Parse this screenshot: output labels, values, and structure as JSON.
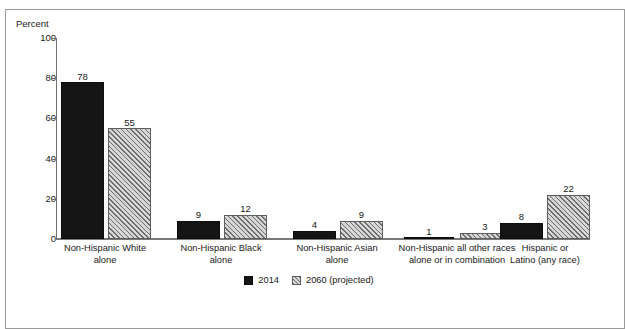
{
  "figure": {
    "background_color": "#fefefe",
    "border_color": "#9a9a9a"
  },
  "chart_data": {
    "type": "bar",
    "title": "",
    "xlabel": "",
    "ylabel": "Percent",
    "ylim": [
      0,
      100
    ],
    "yticks": [
      0,
      20,
      40,
      60,
      80,
      100
    ],
    "grid": false,
    "legend_position": "bottom-center",
    "categories": [
      "Non-Hispanic White alone",
      "Non-Hispanic Black alone",
      "Non-Hispanic Asian alone",
      "Non-Hispanic all other races alone or in combination",
      "Hispanic or Latino (any race)"
    ],
    "category_lines": [
      [
        "Non-Hispanic White",
        "alone"
      ],
      [
        "Non-Hispanic Black",
        "alone"
      ],
      [
        "Non-Hispanic Asian",
        "alone"
      ],
      [
        "Non-Hispanic all other races",
        "alone or in combination"
      ],
      [
        "Hispanic or",
        "Latino (any race)"
      ]
    ],
    "series": [
      {
        "name": "2014",
        "color": "#151515",
        "pattern": "solid",
        "values": [
          78,
          9,
          4,
          1,
          8
        ]
      },
      {
        "name": "2060 (projected)",
        "color": "#c9c9c9",
        "pattern": "diagonal-hatch",
        "values": [
          55,
          12,
          9,
          3,
          22
        ]
      }
    ]
  },
  "legend": {
    "items": [
      {
        "label": "2014",
        "swatch": "solid-black-square"
      },
      {
        "label": "2060 (projected)",
        "swatch": "hatched-gray-square"
      }
    ]
  }
}
